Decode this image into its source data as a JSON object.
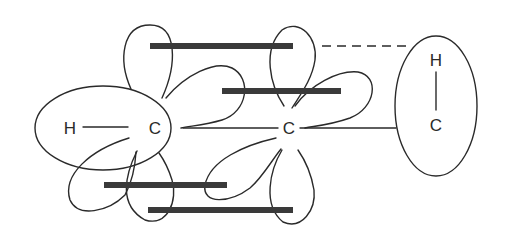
{
  "diagram": {
    "type": "molecular-orbital-sketch",
    "colors": {
      "line": "#2a2a2a",
      "bar": "#3a3a3a",
      "background": "#ffffff"
    },
    "left_group": {
      "atom1": "H",
      "atom2": "C"
    },
    "center_atom": {
      "label": "C"
    },
    "right_group": {
      "atom1": "H",
      "atom2": "C"
    },
    "bars": [
      {
        "id": "bar-top",
        "x1": 150,
        "x2": 293,
        "y": 46
      },
      {
        "id": "bar-upper-mid",
        "x1": 222,
        "x2": 341,
        "y": 91
      },
      {
        "id": "bar-lower-mid",
        "x1": 104,
        "x2": 227,
        "y": 185
      },
      {
        "id": "bar-bottom",
        "x1": 148,
        "x2": 293,
        "y": 210
      }
    ],
    "connectors": {
      "dashed_line": {
        "x1": 322,
        "y1": 46,
        "x2": 406,
        "y2": 46,
        "style": "dashed"
      },
      "bond_left_to_center": {
        "x1": 183,
        "y1": 128,
        "x2": 278,
        "y2": 128
      },
      "bond_center_to_right": {
        "x1": 300,
        "y1": 128,
        "x2": 396,
        "y2": 128
      }
    }
  }
}
